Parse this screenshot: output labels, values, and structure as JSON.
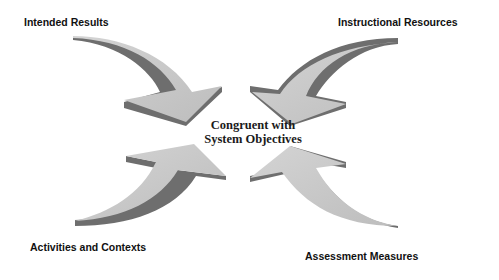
{
  "diagram": {
    "center_label": {
      "line1": "Congruent with",
      "line2": "System Objectives"
    },
    "nodes": [
      {
        "label": "Intended Results",
        "position": "top-left"
      },
      {
        "label": "Instructional Resources",
        "position": "top-right"
      },
      {
        "label": "Activities and Contexts",
        "position": "bottom-left"
      },
      {
        "label": "Assessment Measures",
        "position": "bottom-right"
      }
    ],
    "colors": {
      "arrow_face": "#c8c8c8",
      "arrow_side": "#6e6e6e",
      "text": "#111111"
    }
  }
}
